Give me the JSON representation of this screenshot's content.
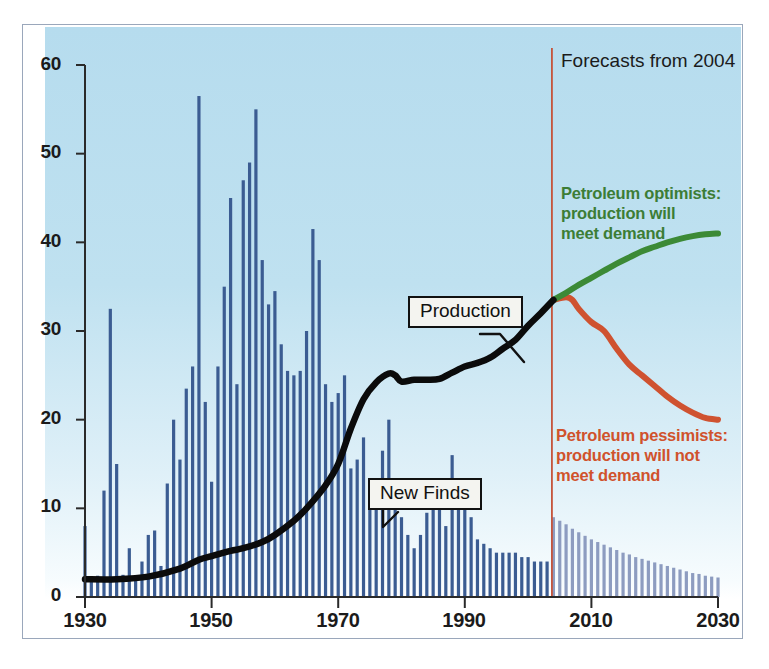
{
  "chart_data": {
    "type": "bar",
    "title": "",
    "subtitle": "",
    "xlabel": "",
    "ylabel": "",
    "xlim": [
      1930,
      2030
    ],
    "ylim": [
      0,
      60
    ],
    "grid": false,
    "legend_position": "inline-annotations",
    "x_ticks": [
      "1930",
      "1950",
      "1970",
      "1990",
      "2010",
      "2030"
    ],
    "y_ticks": [
      "0",
      "10",
      "20",
      "30",
      "40",
      "50",
      "60"
    ],
    "forecast_start_year": 2004,
    "series": [
      {
        "name": "New Finds (historical)",
        "type": "bar",
        "color": "#3b5c92",
        "x": [
          1930,
          1931,
          1932,
          1933,
          1934,
          1935,
          1936,
          1937,
          1938,
          1939,
          1940,
          1941,
          1942,
          1943,
          1944,
          1945,
          1946,
          1947,
          1948,
          1949,
          1950,
          1951,
          1952,
          1953,
          1954,
          1955,
          1956,
          1957,
          1958,
          1959,
          1960,
          1961,
          1962,
          1963,
          1964,
          1965,
          1966,
          1967,
          1968,
          1969,
          1970,
          1971,
          1972,
          1973,
          1974,
          1975,
          1976,
          1977,
          1978,
          1979,
          1980,
          1981,
          1982,
          1983,
          1984,
          1985,
          1986,
          1987,
          1988,
          1989,
          1990,
          1991,
          1992,
          1993,
          1994,
          1995,
          1996,
          1997,
          1998,
          1999,
          2000,
          2001,
          2002,
          2003
        ],
        "values": [
          8.0,
          2.0,
          2.4,
          12.0,
          32.5,
          15.0,
          2.5,
          5.5,
          2.0,
          4.0,
          7.0,
          7.5,
          3.5,
          12.8,
          20.0,
          15.5,
          23.5,
          26.0,
          56.5,
          22.0,
          13.0,
          26.0,
          35.0,
          45.0,
          24.0,
          47.0,
          49.0,
          55.0,
          38.0,
          33.0,
          34.5,
          28.5,
          25.5,
          25.0,
          25.5,
          30.0,
          41.5,
          38.0,
          24.0,
          22.0,
          23.0,
          25.0,
          14.5,
          15.5,
          18.0,
          10.0,
          12.0,
          16.5,
          20.0,
          10.0,
          9.0,
          7.0,
          5.5,
          7.0,
          9.5,
          11.5,
          12.0,
          8.0,
          16.0,
          11.0,
          10.0,
          9.0,
          6.5,
          6.0,
          5.5,
          5.0,
          5.0,
          5.0,
          5.0,
          4.5,
          4.5,
          4.0,
          4.0,
          4.0
        ]
      },
      {
        "name": "New Finds (forecast)",
        "type": "bar",
        "color": "#8d9cc0",
        "x": [
          2004,
          2005,
          2006,
          2007,
          2008,
          2009,
          2010,
          2011,
          2012,
          2013,
          2014,
          2015,
          2016,
          2017,
          2018,
          2019,
          2020,
          2021,
          2022,
          2023,
          2024,
          2025,
          2026,
          2027,
          2028,
          2029,
          2030
        ],
        "values": [
          9.0,
          8.6,
          8.2,
          7.7,
          7.3,
          6.9,
          6.5,
          6.2,
          5.9,
          5.6,
          5.3,
          5.0,
          4.8,
          4.5,
          4.3,
          4.1,
          3.9,
          3.7,
          3.5,
          3.3,
          3.1,
          2.9,
          2.7,
          2.6,
          2.4,
          2.3,
          2.2
        ]
      },
      {
        "name": "Production",
        "type": "line",
        "color": "#0b0b0b",
        "x": [
          1930,
          1935,
          1940,
          1945,
          1948,
          1950,
          1953,
          1955,
          1958,
          1960,
          1963,
          1965,
          1968,
          1970,
          1972,
          1974,
          1976,
          1978,
          1979,
          1980,
          1982,
          1984,
          1986,
          1988,
          1990,
          1992,
          1994,
          1996,
          1998,
          2000,
          2002,
          2004
        ],
        "values": [
          2.0,
          2.0,
          2.3,
          3.2,
          4.2,
          4.6,
          5.2,
          5.5,
          6.2,
          7.0,
          8.6,
          10.0,
          12.6,
          15.0,
          19.0,
          22.3,
          24.2,
          25.2,
          25.0,
          24.3,
          24.5,
          24.5,
          24.6,
          25.3,
          26.0,
          26.4,
          27.0,
          28.0,
          29.0,
          30.6,
          32.0,
          33.5
        ]
      },
      {
        "name": "Petroleum optimists: production will meet demand",
        "type": "line",
        "color": "#3c8a36",
        "x": [
          2004,
          2006,
          2008,
          2010,
          2012,
          2014,
          2016,
          2018,
          2020,
          2022,
          2024,
          2026,
          2028,
          2030
        ],
        "values": [
          33.5,
          34.3,
          35.2,
          36.0,
          36.8,
          37.6,
          38.3,
          39.0,
          39.5,
          40.0,
          40.4,
          40.7,
          40.9,
          41.0
        ]
      },
      {
        "name": "Petroleum pessimists: production will not meet demand",
        "type": "line",
        "color": "#cf5230",
        "x": [
          2004,
          2006,
          2007,
          2008,
          2010,
          2012,
          2014,
          2016,
          2018,
          2020,
          2022,
          2024,
          2026,
          2028,
          2030
        ],
        "values": [
          33.5,
          33.8,
          33.5,
          32.5,
          31.0,
          30.0,
          28.0,
          26.2,
          25.0,
          23.8,
          22.6,
          21.6,
          20.8,
          20.2,
          20.0
        ]
      }
    ],
    "annotations": [
      {
        "id": "forecast-divider",
        "text": "Forecasts from 2004",
        "color": "#1b1b1b",
        "year": 2004
      },
      {
        "id": "optimists-note",
        "text": "Petroleum optimists:\nproduction will\nmeet demand",
        "color": "#3c7d36"
      },
      {
        "id": "pessimists-note",
        "text": "Petroleum pessimists:\nproduction will not\nmeet demand",
        "color": "#d0522c"
      },
      {
        "id": "production-callout",
        "text": "Production",
        "color": "#111111"
      },
      {
        "id": "new-finds-callout",
        "text": "New Finds",
        "color": "#111111"
      }
    ]
  },
  "annotations": {
    "forecast_label": "Forecasts from 2004",
    "optimists_line1": "Petroleum optimists:",
    "optimists_line2": "production will",
    "optimists_line3": "meet demand",
    "pessimists_line1": "Petroleum pessimists:",
    "pessimists_line2": "production will not",
    "pessimists_line3": "meet demand",
    "production_callout": "Production",
    "new_finds_callout": "New Finds"
  },
  "axes": {
    "y_ticks": [
      "60",
      "50",
      "40",
      "30",
      "20",
      "10",
      "0"
    ],
    "x_ticks": [
      "1930",
      "1950",
      "1970",
      "1990",
      "2010",
      "2030"
    ]
  },
  "colors": {
    "panel_top": "#b6dcee",
    "panel_bottom": "#ffffff",
    "bar_historical": "#3b5c92",
    "bar_forecast": "#8d9cc0",
    "production_line": "#0b0b0b",
    "optimists_line": "#3c8a36",
    "pessimists_line": "#cf5230",
    "divider_line": "#c5533a",
    "axis": "#2a2a2a",
    "frame": "#9aa7bb"
  }
}
